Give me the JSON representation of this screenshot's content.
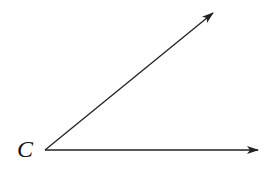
{
  "diagram": {
    "type": "angle",
    "vertex": {
      "label": "C",
      "x": 45,
      "y": 150
    },
    "rays": [
      {
        "name": "upper-ray",
        "from": [
          45,
          150
        ],
        "to": [
          213,
          13
        ]
      },
      {
        "name": "horizontal-ray",
        "from": [
          45,
          150
        ],
        "to": [
          258,
          150
        ]
      }
    ],
    "stroke_color": "#222222",
    "background": "#ffffff"
  }
}
